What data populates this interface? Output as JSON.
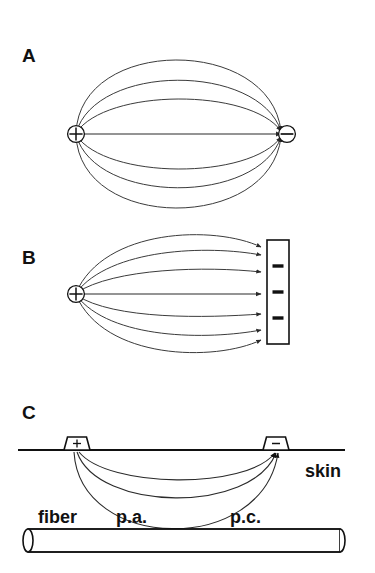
{
  "figure": {
    "background_color": "#ffffff",
    "line_color": "#3b3b3b",
    "ink_color": "#111111",
    "width": 375,
    "height": 573
  },
  "panels": [
    {
      "id": "A",
      "letter": "A",
      "description": "Dipole field between a point source and a point sink",
      "source": {
        "symbol": "+",
        "name": "anode"
      },
      "sink": {
        "symbol": "−",
        "name": "cathode"
      },
      "field_line_count": 7
    },
    {
      "id": "B",
      "letter": "B",
      "description": "Field from a point source to a large plate electrode",
      "source": {
        "symbol": "+",
        "name": "anode"
      },
      "sink": {
        "symbol": "−",
        "name": "plate cathode",
        "dash_count": 3
      },
      "field_line_count": 7
    },
    {
      "id": "C",
      "letter": "C",
      "description": "Surface electrodes on skin with current paths reaching the nerve fiber",
      "anode": {
        "symbol": "+",
        "name": "surface anode"
      },
      "cathode": {
        "symbol": "−",
        "name": "surface cathode"
      },
      "current_path_count": 3,
      "labels": {
        "skin": "skin",
        "fiber": "fiber",
        "physiological_anode": "p.a.",
        "physiological_cathode": "p.c."
      }
    }
  ],
  "icons": {
    "circled_plus": "circled-plus-icon",
    "circled_minus": "circled-minus-icon",
    "electrode": "electrode-icon",
    "cylinder": "nerve-fiber-cylinder-icon"
  }
}
